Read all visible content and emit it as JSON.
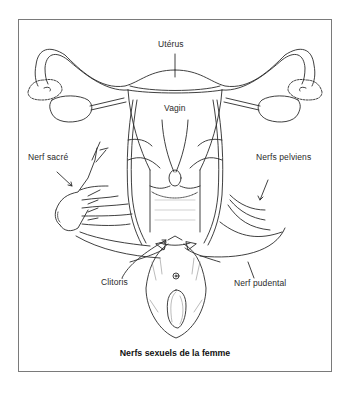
{
  "figure": {
    "caption": "Nerfs sexuels de la femme",
    "labels": {
      "uterus": "Utérus",
      "vagina": "Vagin",
      "sacral_nerve": "Nerf sacré",
      "pelvic_nerves": "Nerfs pelviens",
      "clitoris": "Clitoris",
      "pudendal_nerve": "Nerf pudental"
    },
    "colors": {
      "line": "#2a2a2a",
      "frame": "#7a7a7a",
      "background": "#ffffff"
    }
  }
}
